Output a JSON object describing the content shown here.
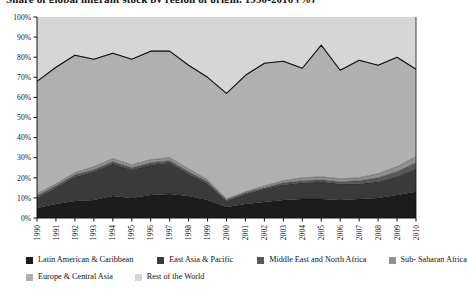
{
  "title": "Share of global migrant stock by region of origin, 1990-2010 (%)",
  "legend": {
    "rows": [
      [
        {
          "label": "Latin American & Caribbean",
          "color": "#1c1c1c",
          "gap": 24
        },
        {
          "label": "East Asia & Pacific",
          "color": "#3a3a3a",
          "gap": 24
        },
        {
          "label": "Middle East and North Africa",
          "color": "#585858",
          "gap": 22
        },
        {
          "label": "Sub- Saharan Africa",
          "color": "#8f8f8f",
          "gap": 0
        }
      ],
      [
        {
          "label": "Europe & Central Asia",
          "color": "#b0b0b0",
          "gap": 22
        },
        {
          "label": "Rest of the World",
          "color": "#d6d6d6",
          "gap": 0
        }
      ]
    ]
  },
  "chart_data": {
    "type": "area",
    "title": "Share of global migrant stock by region of origin, 1990-2010 (%)",
    "xlabel": "",
    "ylabel": "",
    "ylim": [
      0,
      100
    ],
    "xlim": [
      1990,
      2010
    ],
    "ytick_labels": [
      "0%",
      "10%",
      "20%",
      "30%",
      "40%",
      "50%",
      "60%",
      "70%",
      "80%",
      "90%",
      "100%"
    ],
    "ytick_values": [
      0,
      10,
      20,
      30,
      40,
      50,
      60,
      70,
      80,
      90,
      100
    ],
    "grid": false,
    "legend_position": "bottom",
    "stacked": true,
    "normalized_to_100": true,
    "categories": [
      1990,
      1991,
      1992,
      1993,
      1994,
      1995,
      1996,
      1997,
      1998,
      1999,
      2000,
      2001,
      2002,
      2003,
      2004,
      2005,
      2006,
      2007,
      2008,
      2009,
      2010
    ],
    "x_tick_labels": [
      "1990",
      "1991",
      "1992",
      "1993",
      "1994",
      "1995",
      "1996",
      "1997",
      "1998",
      "1999",
      "2000",
      "2001",
      "2002",
      "2003",
      "2004",
      "2005",
      "2006",
      "2007",
      "2008",
      "2009",
      "2010"
    ],
    "series": [
      {
        "name": "Latin American & Caribbean",
        "color": "#1c1c1c",
        "values": [
          5.0,
          7.0,
          8.5,
          9.0,
          11.0,
          10.0,
          11.5,
          12.0,
          11.0,
          9.0,
          5.5,
          7.0,
          8.0,
          9.0,
          9.5,
          9.5,
          9.0,
          9.5,
          10.0,
          11.5,
          13.0
        ]
      },
      {
        "name": "East Asia & Pacific",
        "color": "#3a3a3a",
        "values": [
          5.0,
          8.0,
          12.0,
          14.0,
          16.0,
          14.0,
          15.0,
          15.5,
          11.0,
          8.0,
          3.0,
          5.0,
          6.5,
          7.5,
          8.0,
          8.5,
          8.0,
          7.5,
          8.0,
          9.0,
          11.5
        ]
      },
      {
        "name": "Middle East and North Africa",
        "color": "#585858",
        "values": [
          1.0,
          1.0,
          1.0,
          1.0,
          1.0,
          1.0,
          1.0,
          1.0,
          1.0,
          1.0,
          0.5,
          0.5,
          0.5,
          1.0,
          1.0,
          1.0,
          1.0,
          1.5,
          2.0,
          2.5,
          3.0
        ]
      },
      {
        "name": "Sub- Saharan Africa",
        "color": "#8f8f8f",
        "values": [
          1.0,
          1.0,
          1.0,
          1.5,
          1.5,
          1.5,
          1.5,
          1.5,
          1.5,
          1.0,
          0.5,
          0.5,
          1.0,
          1.0,
          1.5,
          1.5,
          1.5,
          1.5,
          2.0,
          2.5,
          3.0
        ]
      },
      {
        "name": "Europe & Central Asia",
        "color": "#b0b0b0",
        "values": [
          56.0,
          58.0,
          58.5,
          53.5,
          52.5,
          52.5,
          54.0,
          53.0,
          51.5,
          51.0,
          52.5,
          58.0,
          61.0,
          59.5,
          54.5,
          65.5,
          54.0,
          58.5,
          54.0,
          54.5,
          43.5
        ]
      },
      {
        "name": "Rest of the World",
        "color": "#d6d6d6",
        "values": [
          32.0,
          25.0,
          19.0,
          21.0,
          18.0,
          21.0,
          17.0,
          17.0,
          24.0,
          30.0,
          38.0,
          29.0,
          23.0,
          22.0,
          25.5,
          14.0,
          26.5,
          21.5,
          24.0,
          20.0,
          26.0
        ]
      }
    ],
    "upper_boundary_line": {
      "description": "outline of cumulative share of all named regions (top of Europe & Central Asia band)",
      "values": [
        68.0,
        75.0,
        81.0,
        79.0,
        82.0,
        79.0,
        83.0,
        83.0,
        76.0,
        70.0,
        62.0,
        71.0,
        77.0,
        78.0,
        74.5,
        86.0,
        73.5,
        78.5,
        76.0,
        80.0,
        74.0
      ]
    }
  }
}
